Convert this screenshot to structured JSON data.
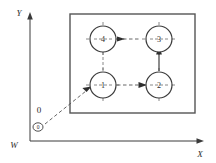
{
  "diagram": {
    "colors": {
      "line": "#3a3a3a",
      "rect": "#555555",
      "dash": "#6b6b6b",
      "text": "#2b2b2b",
      "background": "#ffffff"
    },
    "axes": {
      "y_label": "Y",
      "x_label": "X",
      "origin_label": "W",
      "program_origin_label": "0",
      "origin_mark_label": "0"
    },
    "workpiece": {
      "name": "workpiece-outline",
      "x": 70,
      "y": 14,
      "width": 125,
      "height": 99
    },
    "holes": [
      {
        "label": "1",
        "cx": 103,
        "cy": 85,
        "r": 13
      },
      {
        "label": "2",
        "cx": 159,
        "cy": 85,
        "r": 13
      },
      {
        "label": "3",
        "cx": 159,
        "cy": 39,
        "r": 13
      },
      {
        "label": "4",
        "cx": 103,
        "cy": 39,
        "r": 13
      }
    ],
    "toolpath": {
      "sequence": [
        "W",
        "1",
        "2",
        "3",
        "4"
      ],
      "segments": [
        {
          "name": "approach-w-to-1",
          "from": "W",
          "to": "1",
          "style": "dashed"
        },
        {
          "name": "move-1-to-2",
          "from": "1",
          "to": "2",
          "style": "dashed"
        },
        {
          "name": "move-2-to-3",
          "from": "2",
          "to": "3",
          "style": "dashed"
        },
        {
          "name": "move-3-to-4",
          "from": "3",
          "to": "4",
          "style": "dashed"
        }
      ]
    }
  }
}
